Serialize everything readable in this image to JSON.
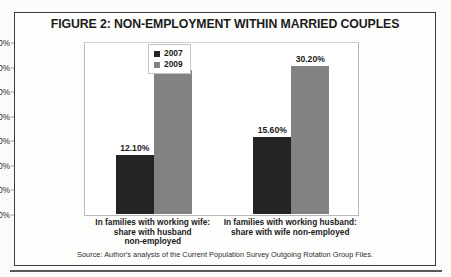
{
  "figure": {
    "title": "FIGURE 2: NON-EMPLOYMENT WITHIN MARRIED COUPLES",
    "source": "Source: Author's analysis of the Current Population Survey Outgoing Rotation Group Files."
  },
  "colors": {
    "series_2007": "#242424",
    "series_2009": "#828282",
    "frame": "#3d3d3d",
    "plot_border": "#b9b9b9",
    "text": "#1b1b1b",
    "page_background": "#fbfbf9"
  },
  "chart_data": {
    "type": "bar",
    "title": "FIGURE 2: NON-EMPLOYMENT WITHIN MARRIED COUPLES",
    "xlabel": "",
    "ylabel": "",
    "ylim": [
      0,
      35
    ],
    "grid": false,
    "legend_position": "center",
    "yticks": [
      "0.00%",
      "5.00%",
      "10.00%",
      "15.00%",
      "20.00%",
      "25.00%",
      "30.00%",
      "35.00%"
    ],
    "ytick_values": [
      0,
      5,
      10,
      15,
      20,
      25,
      30,
      35
    ],
    "categories": [
      "In families with working wife: share with husband non-employed",
      "In families with working husband: share with wife non-employed"
    ],
    "category_lines": [
      [
        "In families with working wife:",
        "share with husband",
        "non-employed"
      ],
      [
        "In families with working husband:",
        "share with wife non-employed"
      ]
    ],
    "series": [
      {
        "name": "2007",
        "color": "#242424",
        "values": [
          12.1,
          15.6
        ],
        "labels": [
          "12.10%",
          "15.60%"
        ]
      },
      {
        "name": "2009",
        "color": "#828282",
        "values": [
          29.4,
          30.2
        ],
        "labels": [
          "29.40%",
          "30.20%"
        ]
      }
    ]
  }
}
